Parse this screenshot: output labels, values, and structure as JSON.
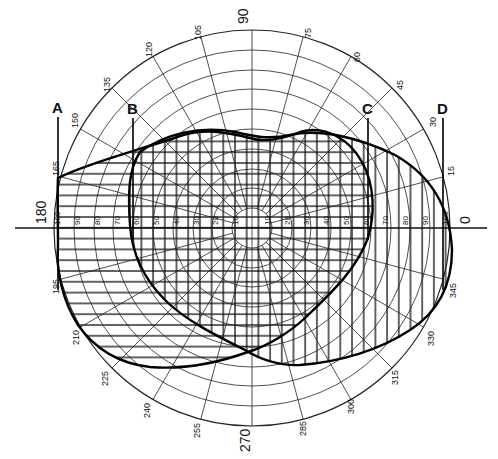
{
  "diagram": {
    "type": "polar-field-overlap",
    "center": [
      252,
      228
    ],
    "unit_px": 1.98,
    "axis_labels": {
      "top": "90",
      "bottom": "270",
      "left": "180",
      "right": "0"
    },
    "angle_labels": [
      {
        "angle": 15,
        "label": "15"
      },
      {
        "angle": 30,
        "label": "30"
      },
      {
        "angle": 45,
        "label": "45"
      },
      {
        "angle": 60,
        "label": "60"
      },
      {
        "angle": 75,
        "label": "75"
      },
      {
        "angle": 105,
        "label": "105"
      },
      {
        "angle": 120,
        "label": "120"
      },
      {
        "angle": 135,
        "label": "135"
      },
      {
        "angle": 150,
        "label": "150"
      },
      {
        "angle": 165,
        "label": "165"
      },
      {
        "angle": 195,
        "label": "195"
      },
      {
        "angle": 210,
        "label": "210"
      },
      {
        "angle": 225,
        "label": "225"
      },
      {
        "angle": 240,
        "label": "240"
      },
      {
        "angle": 255,
        "label": "255"
      },
      {
        "angle": 285,
        "label": "285"
      },
      {
        "angle": 300,
        "label": "300"
      },
      {
        "angle": 315,
        "label": "315"
      },
      {
        "angle": 330,
        "label": "330"
      },
      {
        "angle": 345,
        "label": "345"
      }
    ],
    "ring_values": [
      10,
      20,
      30,
      40,
      50,
      60,
      70,
      80,
      90,
      100
    ],
    "ring_labels_left": [
      "100",
      "90",
      "80",
      "70",
      "60",
      "50",
      "40",
      "30",
      "20",
      "10"
    ],
    "ring_labels_right": [
      "10",
      "20",
      "30",
      "40",
      "50",
      "60",
      "70",
      "80",
      "90",
      "100"
    ],
    "markers": [
      {
        "label": "A",
        "x": 58
      },
      {
        "label": "B",
        "x": 133
      },
      {
        "label": "C",
        "x": 368
      },
      {
        "label": "D",
        "x": 443
      }
    ],
    "regions": [
      {
        "name": "left-field",
        "hatch": "horizontal"
      },
      {
        "name": "right-field",
        "hatch": "vertical"
      },
      {
        "name": "binocular-overlap",
        "hatch": "cross"
      }
    ]
  }
}
